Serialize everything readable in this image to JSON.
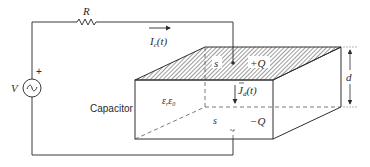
{
  "diagram": {
    "labels": {
      "resistor": "R",
      "source": "V",
      "source_polarity": "+",
      "conduction_current": "I",
      "conduction_current_sub": "c",
      "conduction_current_arg": "(t)",
      "displacement_current": "J",
      "displacement_current_sub": "d",
      "displacement_current_arg": "(t)",
      "top_plate_area": "s",
      "top_plate_charge": "+Q",
      "bottom_plate_area": "s",
      "bottom_plate_charge": "−Q",
      "component": "Capacitor",
      "permittivity": "ε",
      "permittivity_sub1": "r",
      "permittivity_sub2": "0",
      "separation": "d"
    },
    "colors": {
      "line": "#2e2e2e",
      "hatch": "#3a3a3a",
      "background": "#ffffff"
    }
  }
}
